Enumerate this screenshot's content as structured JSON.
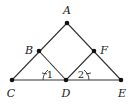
{
  "diagram": {
    "points": {
      "A": {
        "label": "A",
        "x": 67,
        "y": 23,
        "lx": 67,
        "ly": 14
      },
      "B": {
        "label": "B",
        "x": 39,
        "y": 51,
        "lx": 29,
        "ly": 54
      },
      "F": {
        "label": "F",
        "x": 94,
        "y": 51,
        "lx": 104,
        "ly": 54
      },
      "C": {
        "label": "C",
        "x": 12,
        "y": 80,
        "lx": 11,
        "ly": 97
      },
      "D": {
        "label": "D",
        "x": 66,
        "y": 80,
        "lx": 66,
        "ly": 97
      },
      "E": {
        "label": "E",
        "x": 121,
        "y": 80,
        "lx": 122,
        "ly": 97
      }
    },
    "segments": [
      "A-C",
      "A-E",
      "C-E",
      "B-D",
      "F-D"
    ],
    "angles": [
      {
        "label": "1",
        "vertex": "C-D side",
        "x": 49,
        "y": 77
      },
      {
        "label": "2",
        "vertex": "D-E side",
        "x": 82,
        "y": 77
      }
    ],
    "colors": {
      "line": "#333333",
      "point": "#111111"
    }
  }
}
